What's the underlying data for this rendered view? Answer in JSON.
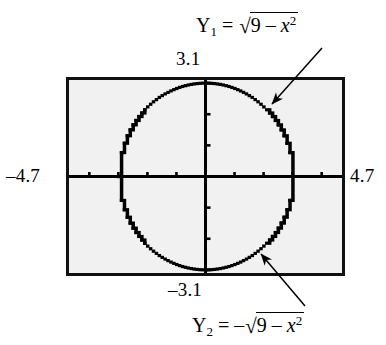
{
  "figure": {
    "caption_top_function": {
      "name": "Y",
      "subscript": "1",
      "equals": "=",
      "sign": "",
      "radicand_a": "9",
      "minus": "–",
      "radicand_var": "x",
      "radicand_exp": "2"
    },
    "caption_bottom_function": {
      "name": "Y",
      "subscript": "2",
      "equals": "=",
      "sign": "–",
      "radicand_a": "9",
      "minus": "–",
      "radicand_var": "x",
      "radicand_exp": "2"
    },
    "window_labels": {
      "ymax": "3.1",
      "ymin": "–3.1",
      "xmin": "–4.7",
      "xmax": "4.7"
    },
    "colors": {
      "screen_background": "#f1f1f1",
      "frame": "#111111",
      "curve": "#000000",
      "page_background": "#ffffff"
    }
  },
  "chart_data": {
    "type": "scatter",
    "title": "",
    "subtitle": "",
    "xlabel": "",
    "ylabel": "",
    "xlim": [
      -4.7,
      4.7
    ],
    "ylim": [
      -3.1,
      3.1
    ],
    "grid": false,
    "legend_position": "annotations",
    "axis_ticks": {
      "x": [
        -4,
        -3,
        -2,
        -1,
        1,
        2,
        3,
        4
      ],
      "y": [
        -3,
        -2,
        -1,
        1,
        2,
        3
      ]
    },
    "axes_drawn": true,
    "annotations": [
      {
        "text": "Y1 = √(9 − x²)",
        "points_to": [
          2.1,
          2.14
        ],
        "arrow_from": [
          3.9,
          3.0
        ]
      },
      {
        "text": "Y2 = −√(9 − x²)",
        "points_to": [
          1.8,
          -2.4
        ],
        "arrow_from": [
          3.4,
          -3.4
        ]
      }
    ],
    "series": [
      {
        "name": "Y1 = √(9 − x²)",
        "equation": "y = sqrt(9 - x^2)",
        "x": [
          -3,
          -2.9,
          -2.8,
          -2.7,
          -2.6,
          -2.5,
          -2.4,
          -2.3,
          -2.2,
          -2.1,
          -2,
          -1.9,
          -1.8,
          -1.7,
          -1.6,
          -1.5,
          -1.4,
          -1.3,
          -1.2,
          -1.1,
          -1,
          -0.9,
          -0.8,
          -0.7,
          -0.6,
          -0.5,
          -0.4,
          -0.3,
          -0.2,
          -0.1,
          0,
          0.1,
          0.2,
          0.3,
          0.4,
          0.5,
          0.6,
          0.7,
          0.8,
          0.9,
          1,
          1.1,
          1.2,
          1.3,
          1.4,
          1.5,
          1.6,
          1.7,
          1.8,
          1.9,
          2,
          2.1,
          2.2,
          2.3,
          2.4,
          2.5,
          2.6,
          2.7,
          2.8,
          2.9,
          3
        ],
        "y": [
          0,
          0.768,
          1.068,
          1.308,
          1.497,
          1.658,
          1.8,
          1.926,
          2.04,
          2.143,
          2.236,
          2.32,
          2.4,
          2.47,
          2.54,
          2.598,
          2.653,
          2.702,
          2.749,
          2.79,
          2.828,
          2.862,
          2.892,
          2.917,
          2.939,
          2.958,
          2.973,
          2.985,
          2.993,
          2.998,
          3,
          2.998,
          2.993,
          2.985,
          2.973,
          2.958,
          2.939,
          2.917,
          2.892,
          2.862,
          2.828,
          2.79,
          2.749,
          2.702,
          2.653,
          2.598,
          2.54,
          2.47,
          2.4,
          2.32,
          2.236,
          2.143,
          2.04,
          1.926,
          1.8,
          1.658,
          1.497,
          1.308,
          1.068,
          0.768,
          0
        ]
      },
      {
        "name": "Y2 = −√(9 − x²)",
        "equation": "y = -sqrt(9 - x^2)",
        "x": [
          -3,
          -2.9,
          -2.8,
          -2.7,
          -2.6,
          -2.5,
          -2.4,
          -2.3,
          -2.2,
          -2.1,
          -2,
          -1.9,
          -1.8,
          -1.7,
          -1.6,
          -1.5,
          -1.4,
          -1.3,
          -1.2,
          -1.1,
          -1,
          -0.9,
          -0.8,
          -0.7,
          -0.6,
          -0.5,
          -0.4,
          -0.3,
          -0.2,
          -0.1,
          0,
          0.1,
          0.2,
          0.3,
          0.4,
          0.5,
          0.6,
          0.7,
          0.8,
          0.9,
          1,
          1.1,
          1.2,
          1.3,
          1.4,
          1.5,
          1.6,
          1.7,
          1.8,
          1.9,
          2,
          2.1,
          2.2,
          2.3,
          2.4,
          2.5,
          2.6,
          2.7,
          2.8,
          2.9,
          3
        ],
        "y": [
          0,
          -0.768,
          -1.068,
          -1.308,
          -1.497,
          -1.658,
          -1.8,
          -1.926,
          -2.04,
          -2.143,
          -2.236,
          -2.32,
          -2.4,
          -2.47,
          -2.54,
          -2.598,
          -2.653,
          -2.702,
          -2.749,
          -2.79,
          -2.828,
          -2.862,
          -2.892,
          -2.917,
          -2.939,
          -2.958,
          -2.973,
          -2.985,
          -2.993,
          -2.998,
          -3,
          -2.998,
          -2.993,
          -2.985,
          -2.973,
          -2.958,
          -2.939,
          -2.917,
          -2.892,
          -2.862,
          -2.828,
          -2.79,
          -2.749,
          -2.702,
          -2.653,
          -2.598,
          -2.54,
          -2.47,
          -2.4,
          -2.32,
          -2.236,
          -2.143,
          -2.04,
          -1.926,
          -1.8,
          -1.658,
          -1.497,
          -1.308,
          -1.068,
          -0.768,
          0
        ]
      }
    ]
  }
}
